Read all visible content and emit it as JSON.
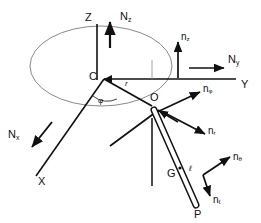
{
  "figure": {
    "stroke_color": "#111111",
    "ellipse_color": "#8a8a8a",
    "background": "#ffffff"
  },
  "points": {
    "center": {
      "label": "C",
      "x": 104,
      "y": 78
    },
    "pivot": {
      "label": "O",
      "x": 152,
      "y": 103
    },
    "mass_center": {
      "label": "G",
      "x": 173,
      "y": 176
    },
    "bob": {
      "label": "P",
      "x": 198,
      "y": 212
    }
  },
  "axes": [
    {
      "name": "z-axis",
      "label": "Z",
      "x": 85,
      "y": 12
    },
    {
      "name": "y-axis",
      "label": "Y",
      "x": 241,
      "y": 84
    },
    {
      "name": "x-axis",
      "label": "X",
      "x": 38,
      "y": 182
    }
  ],
  "inertial_unit_vectors": [
    {
      "name": "N-z",
      "base": "N",
      "sub": "z",
      "x": 106,
      "y": 10
    },
    {
      "name": "N-y",
      "base": "N",
      "sub": "y",
      "x": 231,
      "y": 57
    },
    {
      "name": "N-x",
      "base": "N",
      "sub": "x",
      "x": 10,
      "y": 136
    }
  ],
  "body_unit_vectors": [
    {
      "name": "n-z",
      "base": "n",
      "sub": "z",
      "x": 182,
      "y": 37
    },
    {
      "name": "n-phi",
      "base": "n",
      "sub": "φ",
      "x": 208,
      "y": 91
    },
    {
      "name": "n-r",
      "base": "n",
      "sub": "r",
      "x": 211,
      "y": 130
    },
    {
      "name": "n-theta",
      "base": "n",
      "sub": "θ",
      "x": 235,
      "y": 158
    },
    {
      "name": "n-ell",
      "base": "n",
      "sub": "ℓ",
      "x": 216,
      "y": 198
    }
  ],
  "dimensions": [
    {
      "name": "radius-r",
      "label": "r",
      "x": 125,
      "y": 85
    },
    {
      "name": "angle-phi",
      "label": "φ",
      "x": 100,
      "y": 101
    },
    {
      "name": "rod-length-ell",
      "label": "ℓ",
      "x": 189,
      "y": 170
    }
  ]
}
